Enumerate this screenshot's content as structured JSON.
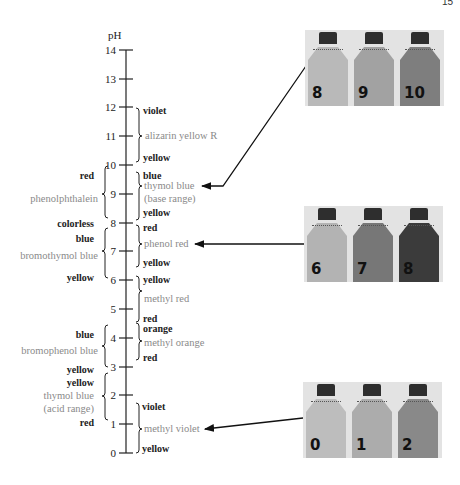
{
  "page_number": "15",
  "axis": {
    "title": "pH",
    "ticks": [
      "0",
      "1",
      "2",
      "3",
      "4",
      "5",
      "6",
      "7",
      "8",
      "9",
      "10",
      "11",
      "12",
      "13",
      "14"
    ]
  },
  "right_indicators": [
    {
      "name": "alizarin yellow R",
      "top_color": "violet",
      "bottom_color": "yellow",
      "range": [
        10.1,
        12.0
      ]
    },
    {
      "name": "thymol blue",
      "name_line2": "(base range)",
      "top_color": "blue",
      "bottom_color": "yellow",
      "range": [
        8.0,
        9.6
      ]
    },
    {
      "name": "phenol red",
      "top_color": "red",
      "bottom_color": "yellow",
      "range": [
        6.4,
        8.0
      ]
    },
    {
      "name": "methyl red",
      "top_color": "red",
      "bottom_color": "yellow",
      "range": [
        4.4,
        6.2
      ]
    },
    {
      "name": "methyl orange",
      "top_color": "orange",
      "bottom_color": "red",
      "range": [
        3.1,
        4.4
      ]
    },
    {
      "name": "methyl violet",
      "top_color": "violet",
      "bottom_color": "yellow",
      "range": [
        0.0,
        1.6
      ]
    }
  ],
  "left_indicators": [
    {
      "name": "phenolphthalein",
      "top_color": "red",
      "bottom_color": "colorless",
      "range": [
        8.2,
        10.0
      ]
    },
    {
      "name": "bromothymol blue",
      "top_color": "blue",
      "bottom_color": "yellow",
      "range": [
        6.0,
        7.6
      ]
    },
    {
      "name": "bromophenol blue",
      "top_color": "blue",
      "bottom_color": "yellow",
      "range": [
        3.0,
        4.6
      ]
    },
    {
      "name": "thymol blue",
      "name_line2": "(acid range)",
      "top_color": "yellow",
      "bottom_color": "red",
      "range": [
        1.2,
        2.8
      ]
    }
  ],
  "photos": [
    {
      "indicator": "thymol blue",
      "bottles": [
        {
          "label": "8",
          "fill": "#b9b9b9"
        },
        {
          "label": "9",
          "fill": "#a2a2a2"
        },
        {
          "label": "10",
          "fill": "#7e7e7e"
        }
      ]
    },
    {
      "indicator": "phenol red",
      "bottles": [
        {
          "label": "6",
          "fill": "#b3b3b3"
        },
        {
          "label": "7",
          "fill": "#777777"
        },
        {
          "label": "8",
          "fill": "#3b3b3b"
        }
      ]
    },
    {
      "indicator": "methyl violet",
      "bottles": [
        {
          "label": "0",
          "fill": "#bdbdbd"
        },
        {
          "label": "1",
          "fill": "#acacac"
        },
        {
          "label": "2",
          "fill": "#898989"
        }
      ]
    }
  ],
  "colors": {
    "axis": "#222222",
    "indicator_name": "#8a8a8a",
    "color_label": "#222222",
    "photo_bg": "#e3e3e3"
  }
}
